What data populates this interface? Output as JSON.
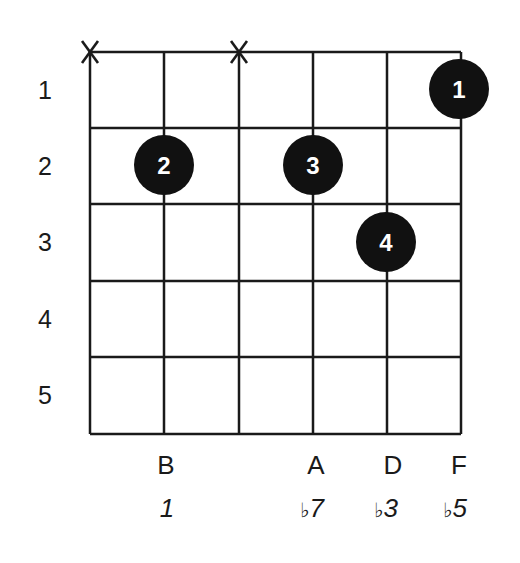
{
  "diagram": {
    "type": "guitar-chord-chart",
    "strings": 6,
    "frets_shown": 5,
    "fret_numbers": [
      "1",
      "2",
      "3",
      "4",
      "5"
    ],
    "muted_strings": [
      1,
      3
    ],
    "fingers": [
      {
        "finger": "1",
        "string": 6,
        "fret": 1
      },
      {
        "finger": "2",
        "string": 2,
        "fret": 2
      },
      {
        "finger": "3",
        "string": 4,
        "fret": 2
      },
      {
        "finger": "4",
        "string": 5,
        "fret": 3
      }
    ],
    "note_names": [
      "",
      "B",
      "",
      "A",
      "D",
      "F"
    ],
    "intervals": [
      {
        "flat": "",
        "num": ""
      },
      {
        "flat": "",
        "num": "1"
      },
      {
        "flat": "",
        "num": ""
      },
      {
        "flat": "♭",
        "num": "7"
      },
      {
        "flat": "♭",
        "num": "3"
      },
      {
        "flat": "♭",
        "num": "5"
      }
    ],
    "mute_symbol": "X",
    "colors": {
      "line": "#1a1a1a",
      "dot": "#111111",
      "dot_text": "#ffffff",
      "background": "#ffffff"
    }
  }
}
